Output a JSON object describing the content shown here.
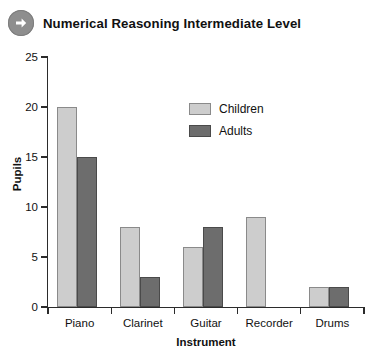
{
  "header": {
    "title": "Numerical Reasoning Intermediate Level",
    "icon": "arrow-right-circle-icon"
  },
  "chart_data": {
    "type": "bar",
    "title": "",
    "categories": [
      "Piano",
      "Clarinet",
      "Guitar",
      "Recorder",
      "Drums"
    ],
    "series": [
      {
        "name": "Children",
        "values": [
          20,
          8,
          6,
          9,
          2
        ],
        "color": "#cdcdcd"
      },
      {
        "name": "Adults",
        "values": [
          15,
          3,
          8,
          0,
          2
        ],
        "color": "#6d6d6d"
      }
    ],
    "xlabel": "Instrument",
    "ylabel": "Pupils",
    "ylim": [
      0,
      25
    ],
    "yticks": [
      0,
      5,
      10,
      15,
      20,
      25
    ],
    "ytick_labels": [
      "0",
      "5",
      "10",
      "15",
      "20",
      "25"
    ],
    "grid": false,
    "legend_position": "inside-top-center"
  }
}
